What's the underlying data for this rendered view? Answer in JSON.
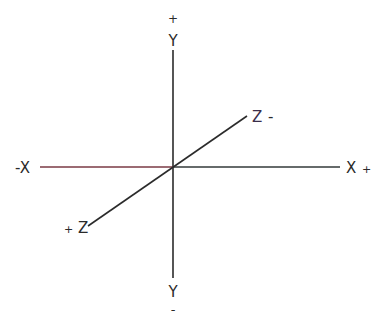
{
  "diagram": {
    "axes": {
      "x": {
        "neg_label": "-X",
        "pos_label": "X",
        "pos_sign": "+"
      },
      "y": {
        "pos_sign": "+",
        "pos_label": "Y",
        "neg_label": "Y",
        "neg_sign": "-"
      },
      "z": {
        "neg_label": "Z",
        "neg_sign": "-",
        "pos_sign": "+",
        "pos_label": "Z"
      }
    },
    "colors": {
      "line": "#2b2b2b",
      "x_neg_tint": "#8a3a44",
      "x_pos_tint": "#3a6a6e",
      "z_label": "#3a2e4a"
    }
  }
}
